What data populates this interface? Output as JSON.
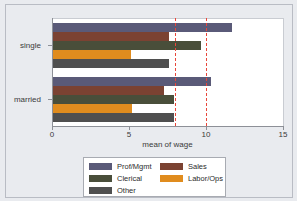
{
  "chart_data": {
    "type": "bar",
    "orientation": "horizontal",
    "title": "",
    "xlabel": "mean of wage",
    "ylabel": "",
    "categories": [
      "single",
      "married"
    ],
    "series": [
      {
        "name": "Prof/Mgmt",
        "color": "#5a5a78",
        "values": [
          11.7,
          10.3
        ]
      },
      {
        "name": "Sales",
        "color": "#7b4232",
        "values": [
          7.6,
          7.3
        ]
      },
      {
        "name": "Clerical",
        "color": "#494e3a",
        "values": [
          9.7,
          7.9
        ]
      },
      {
        "name": "Labor/Ops",
        "color": "#e08c1e",
        "values": [
          5.1,
          5.2
        ]
      },
      {
        "name": "Other",
        "color": "#4f4f4f",
        "values": [
          7.6,
          7.9
        ]
      }
    ],
    "xlim": [
      0,
      15
    ],
    "xticks": [
      0,
      5,
      10,
      15
    ],
    "xticklabels": [
      "0",
      "5",
      "10",
      "15"
    ],
    "grid": false,
    "reference_lines": [
      {
        "value": 8,
        "color": "#e8463a",
        "style": "dashed"
      },
      {
        "value": 10,
        "color": "#e8463a",
        "style": "dashed"
      }
    ],
    "legend": {
      "position": "bottom",
      "columns": [
        [
          "Prof/Mgmt",
          "Clerical",
          "Other"
        ],
        [
          "Sales",
          "Labor/Ops"
        ]
      ]
    }
  },
  "axis": {
    "x_title": "mean of wage",
    "tick_0": "0",
    "tick_5": "5",
    "tick_10": "10",
    "tick_15": "15",
    "cat_single": "single",
    "cat_married": "married"
  },
  "legend": {
    "prof_mgmt": "Prof/Mgmt",
    "clerical": "Clerical",
    "other": "Other",
    "sales": "Sales",
    "labor_ops": "Labor/Ops"
  }
}
